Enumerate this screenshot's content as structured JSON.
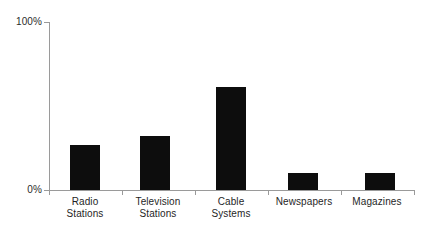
{
  "chart_data": {
    "type": "bar",
    "title": "",
    "subtitle": "",
    "xlabel": "",
    "ylabel": "",
    "categories": [
      "Radio Stations",
      "Television Stations",
      "Cable Systems",
      "Newspapers",
      "Magazines"
    ],
    "category_lines": [
      [
        "Radio",
        "Stations"
      ],
      [
        "Television",
        "Stations"
      ],
      [
        "Cable",
        "Systems"
      ],
      [
        "Newspapers"
      ],
      [
        "Magazines"
      ]
    ],
    "values": [
      27,
      32,
      61,
      10,
      10
    ],
    "value_unit": "%",
    "ylim": [
      0,
      100
    ],
    "ytick_labels": [
      "100%",
      "0%"
    ],
    "ytick_values": [
      100,
      0
    ],
    "grid": false,
    "legend": false,
    "legend_position": "none",
    "bar_color": "#0d0d0d",
    "axis_color": "#9a9a9a",
    "background_color": "#ffffff"
  },
  "axes": {
    "y_top_label": "100%",
    "y_bottom_label": "0%"
  },
  "bars": [
    {
      "label": "Radio Stations",
      "value": 27,
      "left": 70,
      "top": 145,
      "height": 45
    },
    {
      "label": "Television Stations",
      "value": 32,
      "left": 140,
      "top": 136,
      "height": 54
    },
    {
      "label": "Cable Systems",
      "value": 61,
      "left": 216,
      "top": 87,
      "height": 103
    },
    {
      "label": "Newspapers",
      "value": 10,
      "left": 288,
      "top": 173,
      "height": 17
    },
    {
      "label": "Magazines",
      "value": 10,
      "left": 365,
      "top": 173,
      "height": 17
    }
  ],
  "category_labels": [
    {
      "line1": "Radio",
      "line2": "Stations",
      "center": 85
    },
    {
      "line1": "Television",
      "line2": "Stations",
      "center": 158
    },
    {
      "line1": "Cable",
      "line2": "Systems",
      "center": 231
    },
    {
      "line1": "Newspapers",
      "line2": "",
      "center": 304
    },
    {
      "line1": "Magazines",
      "line2": "",
      "center": 377
    }
  ],
  "x_ticks": [
    49,
    122,
    195,
    268,
    341,
    414
  ]
}
